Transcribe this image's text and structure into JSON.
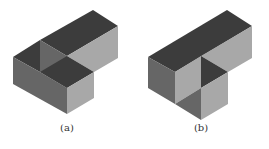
{
  "figures": [
    {
      "id": "a",
      "caption": "(a)"
    },
    {
      "id": "b",
      "caption": "(b)"
    }
  ],
  "colors": {
    "top_face": "#3c3c3c",
    "left_face": "#666666",
    "right_face": "#a8a8a8",
    "background": "#ffffff"
  }
}
